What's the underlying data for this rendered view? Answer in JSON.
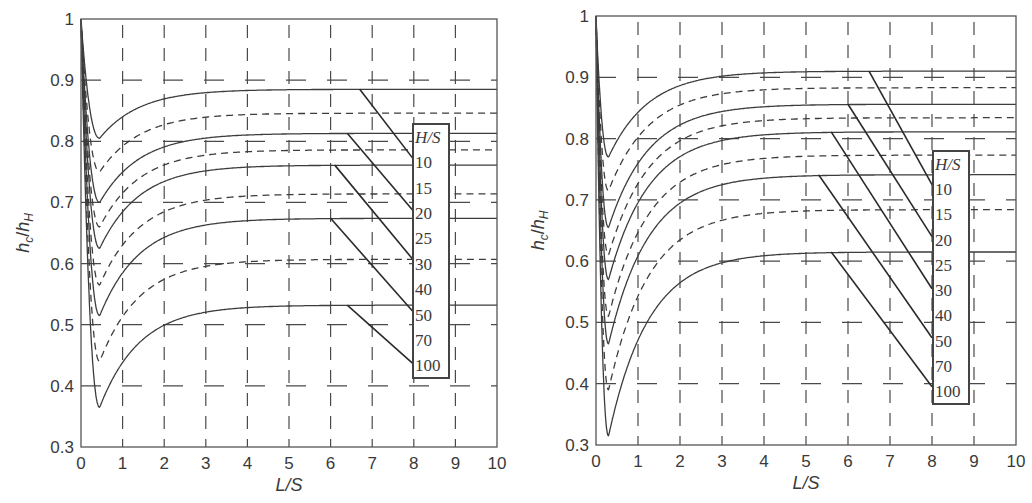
{
  "chart_data": [
    {
      "type": "line",
      "panel": "left",
      "title": "",
      "xlabel": "L/S",
      "ylabel": "h_c/h_H",
      "xlim": [
        0,
        10
      ],
      "ylim": [
        0.3,
        1
      ],
      "xticks": [
        "0",
        "1",
        "2",
        "3",
        "4",
        "5",
        "6",
        "7",
        "8",
        "9",
        "10"
      ],
      "yticks": [
        "0.3",
        "0.4",
        "0.5",
        "0.6",
        "0.7",
        "0.8",
        "0.9",
        "1"
      ],
      "grid": true,
      "legend": {
        "title": "H/S",
        "entries": [
          "10",
          "15",
          "20",
          "25",
          "30",
          "40",
          "50",
          "70",
          "100"
        ],
        "position": "right, inside"
      },
      "series": [
        {
          "name": "10",
          "style": "solid",
          "start": 1.0,
          "min_x": 0.45,
          "min_y": 0.805,
          "plateau": 0.885
        },
        {
          "name": "15",
          "style": "dashed",
          "start": 1.0,
          "min_x": 0.45,
          "min_y": 0.75,
          "plateau": 0.846
        },
        {
          "name": "20",
          "style": "solid",
          "start": 1.0,
          "min_x": 0.45,
          "min_y": 0.7,
          "plateau": 0.813
        },
        {
          "name": "25",
          "style": "dashed",
          "start": 1.0,
          "min_x": 0.45,
          "min_y": 0.66,
          "plateau": 0.786
        },
        {
          "name": "30",
          "style": "solid",
          "start": 1.0,
          "min_x": 0.45,
          "min_y": 0.625,
          "plateau": 0.761
        },
        {
          "name": "40",
          "style": "dashed",
          "start": 1.0,
          "min_x": 0.45,
          "min_y": 0.565,
          "plateau": 0.714
        },
        {
          "name": "50",
          "style": "solid",
          "start": 1.0,
          "min_x": 0.45,
          "min_y": 0.515,
          "plateau": 0.674
        },
        {
          "name": "70",
          "style": "dashed",
          "start": 1.0,
          "min_x": 0.45,
          "min_y": 0.44,
          "plateau": 0.607
        },
        {
          "name": "100",
          "style": "solid",
          "start": 1.0,
          "min_x": 0.45,
          "min_y": 0.365,
          "plateau": 0.532
        }
      ],
      "leaders": [
        {
          "label": "10",
          "from": [
            6.7,
            0.885
          ],
          "to": [
            8,
            0.77
          ]
        },
        {
          "label": "20",
          "from": [
            6.4,
            0.813
          ],
          "to": [
            8,
            0.685
          ]
        },
        {
          "label": "30",
          "from": [
            6.1,
            0.761
          ],
          "to": [
            8,
            0.605
          ]
        },
        {
          "label": "50",
          "from": [
            6.0,
            0.674
          ],
          "to": [
            8,
            0.52
          ]
        },
        {
          "label": "100",
          "from": [
            6.4,
            0.532
          ],
          "to": [
            8,
            0.435
          ]
        }
      ]
    },
    {
      "type": "line",
      "panel": "right",
      "title": "",
      "xlabel": "L/S",
      "ylabel": "h_c/h_H",
      "xlim": [
        0,
        10
      ],
      "ylim": [
        0.3,
        1
      ],
      "xticks": [
        "0",
        "1",
        "2",
        "3",
        "4",
        "5",
        "6",
        "7",
        "8",
        "9",
        "10"
      ],
      "yticks": [
        "0.3",
        "0.4",
        "0.5",
        "0.6",
        "0.7",
        "0.8",
        "0.9",
        "1"
      ],
      "grid": true,
      "legend": {
        "title": "H/S",
        "entries": [
          "10",
          "15",
          "20",
          "25",
          "30",
          "40",
          "50",
          "70",
          "100"
        ],
        "position": "right, inside"
      },
      "series": [
        {
          "name": "10",
          "style": "solid",
          "start": 1.0,
          "min_x": 0.3,
          "min_y": 0.77,
          "plateau": 0.91
        },
        {
          "name": "15",
          "style": "dashed",
          "start": 1.0,
          "min_x": 0.3,
          "min_y": 0.715,
          "plateau": 0.883
        },
        {
          "name": "20",
          "style": "solid",
          "start": 1.0,
          "min_x": 0.3,
          "min_y": 0.655,
          "plateau": 0.856
        },
        {
          "name": "25",
          "style": "dashed",
          "start": 1.0,
          "min_x": 0.3,
          "min_y": 0.61,
          "plateau": 0.834
        },
        {
          "name": "30",
          "style": "solid",
          "start": 1.0,
          "min_x": 0.3,
          "min_y": 0.57,
          "plateau": 0.811
        },
        {
          "name": "40",
          "style": "dashed",
          "start": 1.0,
          "min_x": 0.3,
          "min_y": 0.51,
          "plateau": 0.773
        },
        {
          "name": "50",
          "style": "solid",
          "start": 1.0,
          "min_x": 0.3,
          "min_y": 0.465,
          "plateau": 0.741
        },
        {
          "name": "70",
          "style": "dashed",
          "start": 1.0,
          "min_x": 0.3,
          "min_y": 0.39,
          "plateau": 0.684
        },
        {
          "name": "100",
          "style": "solid",
          "start": 1.0,
          "min_x": 0.3,
          "min_y": 0.315,
          "plateau": 0.615
        }
      ],
      "leaders": [
        {
          "label": "10",
          "from": [
            6.5,
            0.91
          ],
          "to": [
            8,
            0.725
          ]
        },
        {
          "label": "20",
          "from": [
            6.0,
            0.856
          ],
          "to": [
            8,
            0.64
          ]
        },
        {
          "label": "30",
          "from": [
            5.6,
            0.811
          ],
          "to": [
            8,
            0.555
          ]
        },
        {
          "label": "50",
          "from": [
            5.3,
            0.741
          ],
          "to": [
            8,
            0.475
          ]
        },
        {
          "label": "100",
          "from": [
            5.6,
            0.615
          ],
          "to": [
            8,
            0.395
          ]
        }
      ]
    }
  ],
  "layout": {
    "panels": [
      {
        "x0": 81,
        "x1": 497,
        "y_top": 19,
        "y_bot": 447,
        "legend_box": [
          413,
          124,
          36,
          254
        ]
      },
      {
        "x0": 596,
        "x1": 1016,
        "y_top": 16,
        "y_bot": 445,
        "legend_box": [
          933,
          151,
          36,
          253
        ]
      }
    ],
    "line_color": "#3c3c3c",
    "grid_color": "#4a4a4a"
  }
}
